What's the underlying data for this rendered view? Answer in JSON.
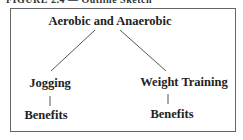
{
  "caption": "FIGURE 2.4 — Outline Sketch",
  "diagram": {
    "root": "Aerobic and Anaerobic",
    "branches": [
      {
        "label": "Jogging",
        "child": "Benefits"
      },
      {
        "label": "Weight Training",
        "child": "Benefits"
      }
    ]
  }
}
